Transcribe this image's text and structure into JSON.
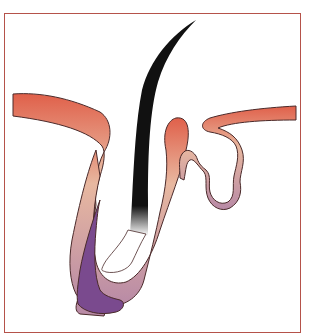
{
  "figure": {
    "labels": []
  },
  "colors": {
    "frame": "#b5524a",
    "outline": "#4a2a2a",
    "outer_sheath_top": "#e0604a",
    "outer_sheath_mid": "#e8b8a0",
    "outer_sheath_bottom": "#b88aa6",
    "inner_sheath": "#7a4a8e",
    "hair_shaft": "#111111",
    "bulb": "#ffffff"
  }
}
